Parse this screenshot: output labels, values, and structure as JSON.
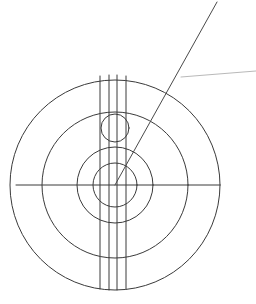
{
  "document": {
    "title": "Concentric Circle Technical Drawing",
    "background_color": "#ffffff",
    "width": 256,
    "height": 304
  },
  "style": {
    "line_color": "#3a3a3a",
    "leader_color": "#4a4a4a",
    "faint_line_color": "#b9b9b9",
    "stroke_width": 1.0,
    "faint_stroke_width": 1.0
  },
  "geometry": {
    "center": {
      "x": 115,
      "y": 185
    },
    "concentric_circles": [
      {
        "name": "innermost-circle",
        "radius": 22
      },
      {
        "name": "inner-circle",
        "radius": 38
      },
      {
        "name": "middle-circle",
        "radius": 73
      },
      {
        "name": "outer-circle",
        "radius": 105
      }
    ],
    "offset_circle": {
      "name": "small-offset-circle",
      "cx": 115,
      "cy": 128,
      "radius": 14
    },
    "vertical_lines": [
      {
        "name": "vertical-line-1",
        "x": 100,
        "y1": 76,
        "y2": 289
      },
      {
        "name": "vertical-line-2",
        "x": 109,
        "y1": 75,
        "y2": 290
      },
      {
        "name": "vertical-line-3",
        "x": 117,
        "y1": 75,
        "y2": 290
      },
      {
        "name": "vertical-line-4",
        "x": 126,
        "y1": 76,
        "y2": 289
      }
    ],
    "horizontal_axis": {
      "name": "horizontal-axis-line",
      "x1": 16,
      "x2": 219,
      "y": 185
    },
    "leader_line": {
      "name": "diagonal-leader-line",
      "x1": 217,
      "y1": 2,
      "x2": 115,
      "y2": 185
    },
    "faint_line": {
      "name": "faint-annotation-line",
      "x1": 181,
      "y1": 77,
      "x2": 256,
      "y2": 71
    }
  }
}
